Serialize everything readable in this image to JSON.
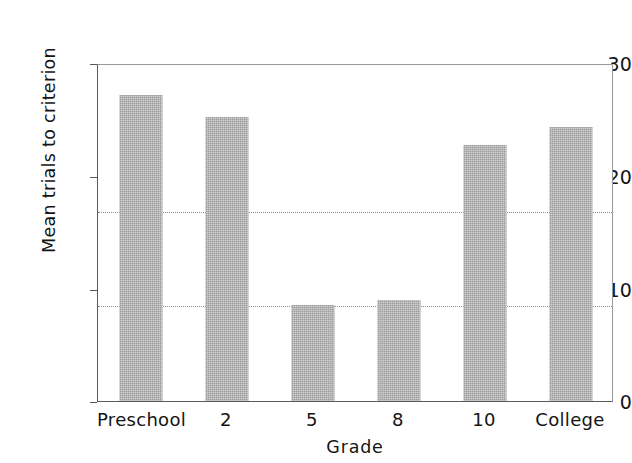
{
  "chart_data": {
    "type": "bar",
    "title": "",
    "xlabel": "Grade",
    "ylabel": "Mean trials to criterion",
    "categories": [
      "Preschool",
      "2",
      "5",
      "8",
      "10",
      "College"
    ],
    "values": [
      32.3,
      30.0,
      10.1,
      10.7,
      27.1,
      29.0
    ],
    "series": [
      {
        "name": "Mean trials to criterion",
        "values": [
          32.3,
          30.0,
          10.1,
          10.7,
          27.1,
          29.0
        ]
      }
    ],
    "ylim": [
      0,
      35.5
    ],
    "y_ticks": [
      0,
      10,
      20,
      30
    ],
    "y_tick_labels": [
      "0",
      "10",
      "20",
      "30"
    ],
    "grid": "horizontal-dotted",
    "legend": "none",
    "bar_color": "#9d9d9d",
    "axis_color": "#5a5a5a",
    "background_color": "#ffffff"
  },
  "axes": {
    "y_title": "Mean trials to criterion",
    "x_title": "Grade",
    "y_labels": [
      "0",
      "10",
      "20",
      "30"
    ],
    "x_labels": [
      "Preschool",
      "2",
      "5",
      "8",
      "10",
      "College"
    ]
  },
  "bars": [
    {
      "label": "Preschool",
      "value": 32.3
    },
    {
      "label": "2",
      "value": 30.0
    },
    {
      "label": "5",
      "value": 10.1
    },
    {
      "label": "8",
      "value": 10.7
    },
    {
      "label": "10",
      "value": 27.1
    },
    {
      "label": "College",
      "value": 29.0
    }
  ]
}
